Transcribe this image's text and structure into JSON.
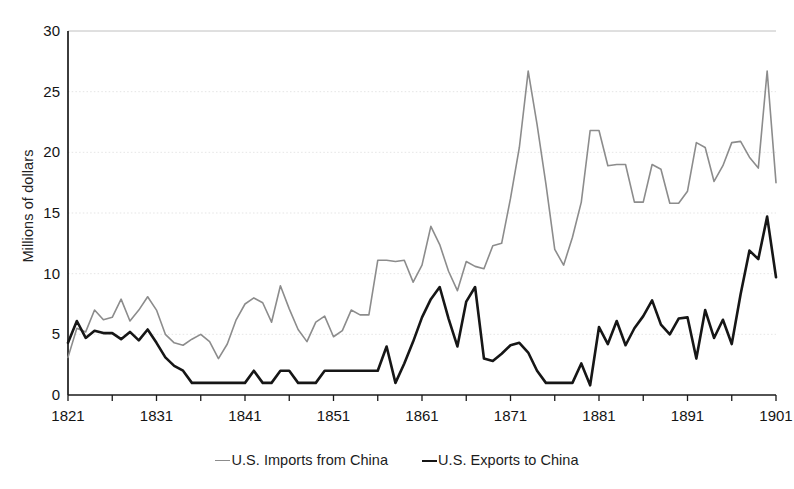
{
  "chart_data": {
    "type": "line",
    "title": "",
    "xlabel": "",
    "ylabel": "Millions of dollars",
    "xlim": [
      1821,
      1901
    ],
    "ylim": [
      0,
      30
    ],
    "yticks": [
      0,
      5,
      10,
      15,
      20,
      25,
      30
    ],
    "xticks": [
      1821,
      1831,
      1841,
      1851,
      1861,
      1871,
      1881,
      1891,
      1901
    ],
    "xtick_minor_step": 5,
    "grid": "horizontal-dotted-light",
    "legend_position": "bottom-center",
    "x": [
      1821,
      1822,
      1823,
      1824,
      1825,
      1826,
      1827,
      1828,
      1829,
      1830,
      1831,
      1832,
      1833,
      1834,
      1835,
      1836,
      1837,
      1838,
      1839,
      1840,
      1841,
      1842,
      1843,
      1844,
      1845,
      1846,
      1847,
      1848,
      1849,
      1850,
      1851,
      1852,
      1853,
      1854,
      1855,
      1856,
      1857,
      1858,
      1859,
      1860,
      1861,
      1862,
      1863,
      1864,
      1865,
      1866,
      1867,
      1868,
      1869,
      1870,
      1871,
      1872,
      1873,
      1874,
      1875,
      1876,
      1877,
      1878,
      1879,
      1880,
      1881,
      1882,
      1883,
      1884,
      1885,
      1886,
      1887,
      1888,
      1889,
      1890,
      1891,
      1892,
      1893,
      1894,
      1895,
      1896,
      1897,
      1898,
      1899,
      1900,
      1901
    ],
    "series": [
      {
        "name": "U.S. Imports from China",
        "color": "#8c8c8c",
        "line_width": 1.6,
        "values": [
          3.1,
          5.5,
          5.2,
          7.0,
          6.2,
          6.4,
          7.9,
          6.1,
          7.0,
          8.1,
          7.0,
          5.0,
          4.3,
          4.1,
          4.6,
          5.0,
          4.4,
          3.0,
          4.2,
          6.2,
          7.5,
          8.0,
          7.6,
          6.0,
          9.0,
          7.1,
          5.4,
          4.4,
          6.0,
          6.5,
          4.8,
          5.3,
          7.0,
          6.6,
          6.6,
          11.1,
          11.1,
          11.0,
          11.1,
          9.3,
          10.7,
          13.9,
          12.4,
          10.2,
          8.6,
          11.0,
          10.6,
          10.4,
          12.3,
          12.5,
          16.2,
          20.4,
          26.7,
          22.3,
          17.4,
          12.0,
          10.7,
          13.0,
          15.9,
          21.8,
          21.8,
          18.9,
          19.0,
          19.0,
          15.9,
          15.9,
          19.0,
          18.6,
          15.8,
          15.8,
          16.8,
          20.8,
          20.4,
          17.6,
          18.9,
          20.8,
          20.9,
          19.6,
          18.7,
          26.7,
          17.5
        ]
      },
      {
        "name": "U.S. Exports to China",
        "color": "#161616",
        "line_width": 2.6,
        "values": [
          4.3,
          6.1,
          4.7,
          5.3,
          5.1,
          5.1,
          4.6,
          5.2,
          4.5,
          5.4,
          4.3,
          3.1,
          2.4,
          2.0,
          1.0,
          1.0,
          1.0,
          1.0,
          1.0,
          1.0,
          1.0,
          2.0,
          1.0,
          1.0,
          2.0,
          2.0,
          1.0,
          1.0,
          1.0,
          2.0,
          2.0,
          2.0,
          2.0,
          2.0,
          2.0,
          2.0,
          4.0,
          1.0,
          2.6,
          4.4,
          6.4,
          7.9,
          8.9,
          6.3,
          4.0,
          7.7,
          8.9,
          3.0,
          2.8,
          3.4,
          4.1,
          4.3,
          3.5,
          2.0,
          1.0,
          1.0,
          1.0,
          1.0,
          2.6,
          0.8,
          5.6,
          4.2,
          6.1,
          4.1,
          5.5,
          6.5,
          7.8,
          5.8,
          5.0,
          6.3,
          6.4,
          3.0,
          7.0,
          4.7,
          6.2,
          4.2,
          8.3,
          11.9,
          11.2,
          14.7,
          9.7
        ]
      }
    ]
  },
  "legend": {
    "items": [
      {
        "dash": "—",
        "label": "U.S. Imports from China",
        "series": "imports"
      },
      {
        "dash": "—",
        "label": "U.S. Exports to China",
        "series": "exports"
      }
    ]
  }
}
